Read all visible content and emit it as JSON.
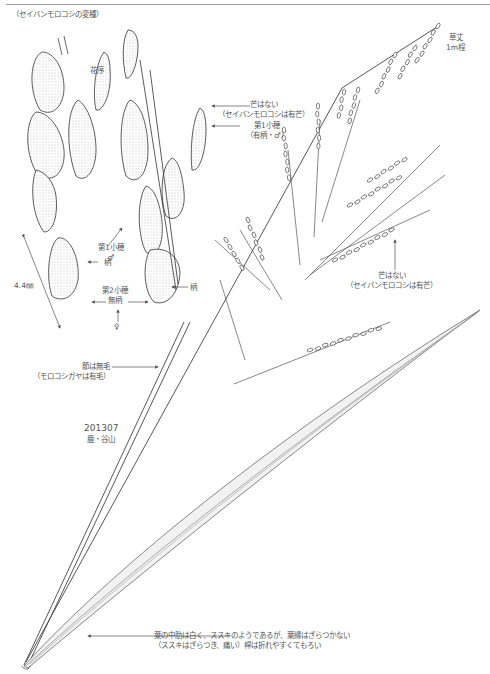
{
  "figure": {
    "subtitle": "（セイバンモロコシの変種）",
    "inflorescence_label": "花序",
    "height": [
      "草丈",
      "1m程"
    ],
    "awnless_spikelet": [
      "芒はない",
      "（セイバンモロコシは有芒）"
    ],
    "first_spikelet_top": [
      "第1小穂",
      "（有柄・♂）"
    ],
    "first_spikelet_left": [
      "第1小穂",
      "♂"
    ],
    "stalk_left": "柄",
    "stalk_right": "柄",
    "measure": "4.4㎜",
    "second_spikelet": [
      "第2小穂",
      "無柄"
    ],
    "female_mark": "♀",
    "awnless_branch": [
      "芒はない",
      "（セイバンモロコシは有芒）"
    ],
    "node": [
      "節は無毛",
      "（モロコシガヤは有毛）"
    ],
    "collection": [
      "201307",
      "鹿・谷山"
    ],
    "leaf_note": [
      "葉の中肋は白く、ススキのようであるが、葉縁はざらつかない",
      "（ススキはざらつき、痛い）稈は折れやすくてもろい"
    ]
  }
}
